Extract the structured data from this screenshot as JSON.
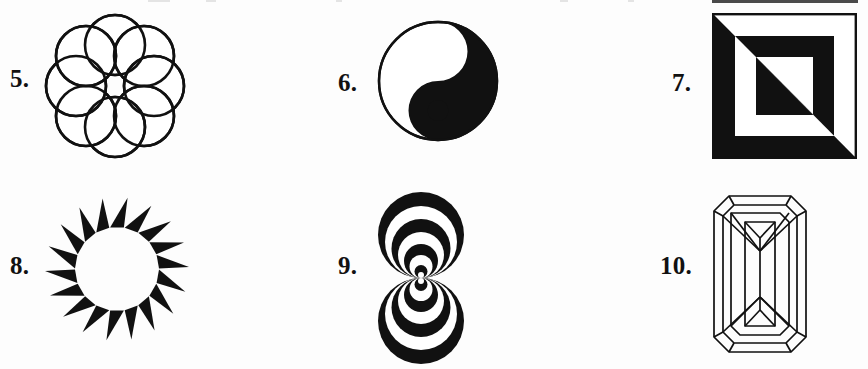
{
  "page": {
    "background_color": "#fdfdfd",
    "ink_color": "#111111",
    "width": 868,
    "height": 369,
    "layout": "3 columns x 2 rows of numbered figures"
  },
  "figures": [
    {
      "number": "5.",
      "name": "rosette-of-eight-overlapping-circles",
      "description": "Ring of eight equal outlined circles arranged around a common center, each overlapping its two neighbours, forming a flower-like rosette with an open centre.",
      "style": "outline",
      "stroke_color": "#111111",
      "fill_color": "none",
      "count": 8,
      "label_x": 10,
      "label_y": 66,
      "art_x": 40,
      "art_y": 8,
      "art_w": 150,
      "art_h": 155
    },
    {
      "number": "6.",
      "name": "yin-yang-taijitu",
      "description": "Classic taijitu: circle divided by an S-curve into a black half and a white half, each half containing a small dot of the opposite colour.",
      "style": "solid",
      "stroke_color": "#111111",
      "fill_color": "#111111",
      "count": 1,
      "label_x": 338,
      "label_y": 70,
      "art_x": 376,
      "art_y": 18,
      "art_w": 124,
      "art_h": 126
    },
    {
      "number": "7.",
      "name": "concentric-squares-diagonal-inversion",
      "description": "Three concentric squares whose colours invert across the anti-diagonal: the upper-right triangle reads white-black-white while the lower-left triangle reads black-white-black.",
      "style": "solid",
      "stroke_color": "#111111",
      "fill_color": "#111111",
      "count": 3,
      "label_x": 672,
      "label_y": 70,
      "art_x": 712,
      "art_y": 13,
      "art_w": 145,
      "art_h": 146
    },
    {
      "number": "8.",
      "name": "sunburst-ring-of-triangles",
      "description": "Eighteen solid black triangular spikes arranged in a ring, each tilted tangentially so the ring reads as a spinning sunburst with a clear circular centre.",
      "style": "solid",
      "stroke_color": "#111111",
      "fill_color": "#111111",
      "count": 18,
      "label_x": 10,
      "label_y": 253,
      "art_x": 44,
      "art_y": 193,
      "art_w": 146,
      "art_h": 152
    },
    {
      "number": "9.",
      "name": "double-nested-tangent-circles",
      "description": "Two mirrored stacks of nested black-and-white circles, all internally tangent at one shared central point, producing a figure-eight / hourglass moire illusion.",
      "style": "solid",
      "stroke_color": "#111111",
      "fill_color": "#111111",
      "count": 14,
      "label_x": 338,
      "label_y": 253,
      "art_x": 372,
      "art_y": 192,
      "art_w": 98,
      "art_h": 172
    },
    {
      "number": "10.",
      "name": "emerald-cut-gem-diagram",
      "description": "Line drawing of an emerald-cut gemstone: nested octagonal outlines with cut corners plus converging crown facets meeting at the top and bottom of the rectangular table.",
      "style": "outline",
      "stroke_color": "#111111",
      "fill_color": "none",
      "count": 1,
      "label_x": 660,
      "label_y": 253,
      "art_x": 712,
      "art_y": 194,
      "art_w": 96,
      "art_h": 160
    }
  ]
}
